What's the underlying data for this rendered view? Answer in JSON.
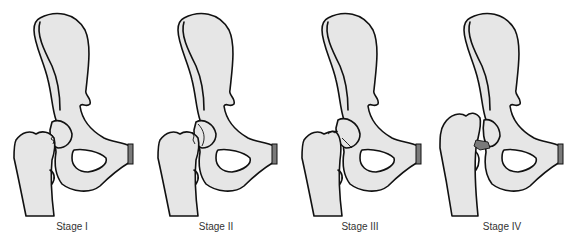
{
  "figure": {
    "colors": {
      "bone_fill": "#e6e6e6",
      "outline": "#111111",
      "symphysis_cap": "#7a7a7a",
      "caption_text": "#333333",
      "background": "#ffffff"
    },
    "stages": [
      {
        "label": "Stage I",
        "x": 0
      },
      {
        "label": "Stage II",
        "x": 144
      },
      {
        "label": "Stage III",
        "x": 288
      },
      {
        "label": "Stage IV",
        "x": 430
      }
    ]
  }
}
